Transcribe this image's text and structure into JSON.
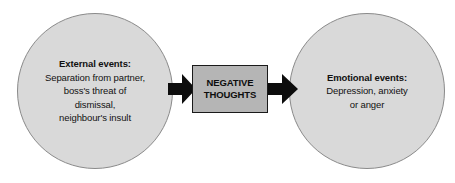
{
  "diagram": {
    "background_color": "#ffffff",
    "circle_fill": "#d9d9d9",
    "box_fill": "#b5b5b5",
    "arrow_color": "#0d0d0d",
    "text_color": "#111111"
  },
  "nodes": {
    "external": {
      "heading": "External events:",
      "lines": [
        "Separation from partner,",
        "boss's threat of",
        "dismissal,",
        "neighbour's insult"
      ]
    },
    "center": {
      "lines": [
        "NEGATIVE",
        "THOUGHTS"
      ]
    },
    "emotional": {
      "heading": "Emotional events:",
      "lines": [
        "Depression, anxiety",
        "or anger"
      ]
    }
  },
  "connectors": [
    {
      "name": "arrow-left",
      "from": "external",
      "to": "center",
      "direction": "right"
    },
    {
      "name": "arrow-right",
      "from": "center",
      "to": "emotional",
      "direction": "right"
    }
  ]
}
